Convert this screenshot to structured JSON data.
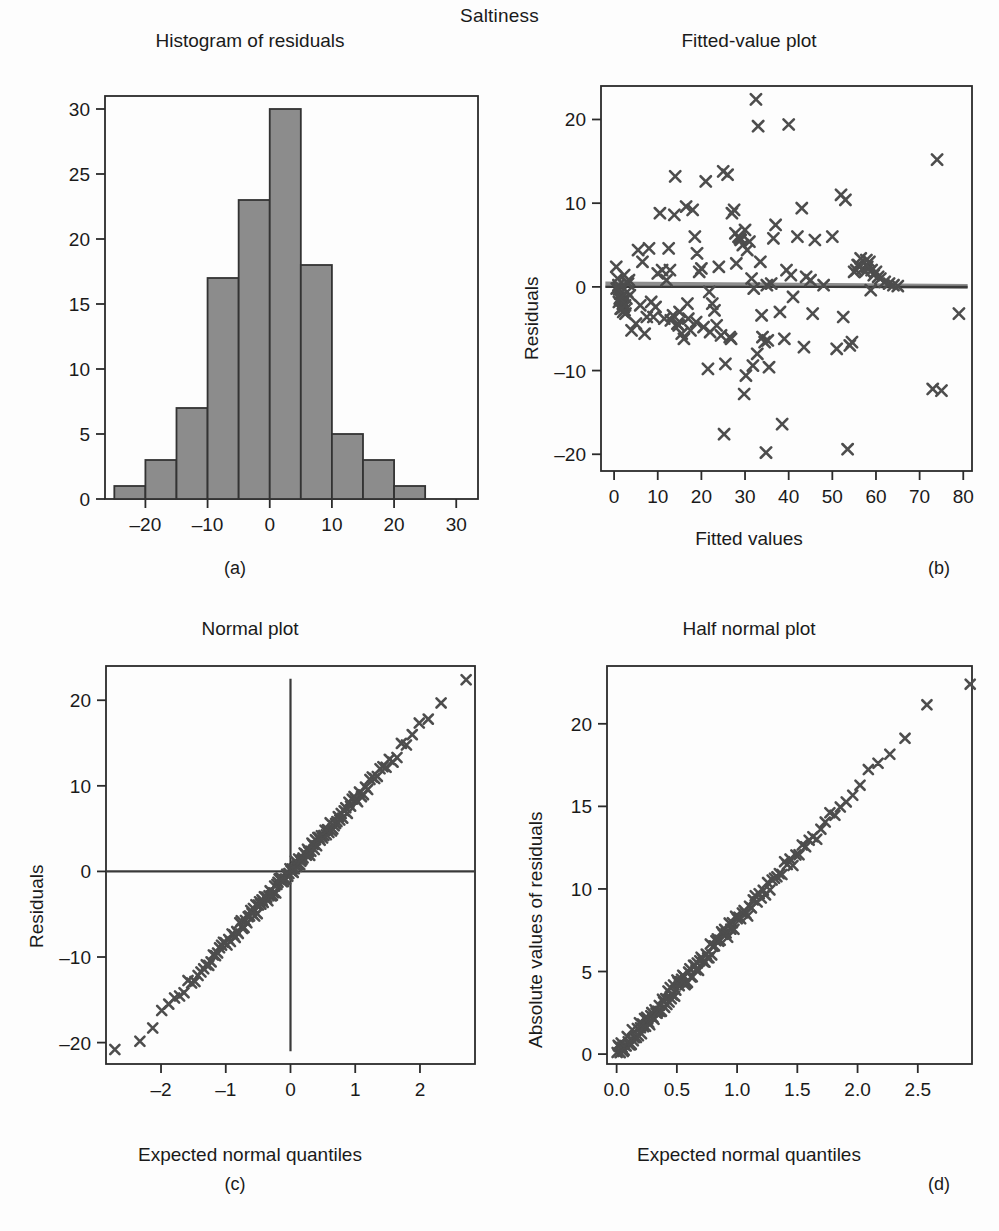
{
  "figure": {
    "suptitle": "Saltiness",
    "marker_color": "#4d4d4d",
    "bar_fill": "#8c8c8c",
    "bar_stroke": "#333333",
    "axis_color": "#2b2b2b"
  },
  "panels": [
    {
      "id": "a",
      "caption": "(a)",
      "title": "Histogram of residuals",
      "xlabel": "",
      "ylabel": "",
      "xticks": [
        -20,
        -10,
        0,
        10,
        20,
        30
      ],
      "xtick_labels": [
        "–20",
        "–10",
        "0",
        "10",
        "20",
        "30"
      ],
      "yticks": [
        0,
        5,
        10,
        15,
        20,
        25,
        30
      ],
      "ytick_labels": [
        "0",
        "5",
        "10",
        "15",
        "20",
        "25",
        "30"
      ]
    },
    {
      "id": "b",
      "caption": "(b)",
      "title": "Fitted-value plot",
      "xlabel": "Fitted values",
      "ylabel": "Residuals",
      "xticks": [
        0,
        10,
        20,
        30,
        40,
        50,
        60,
        70,
        80
      ],
      "xtick_labels": [
        "0",
        "10",
        "20",
        "30",
        "40",
        "50",
        "60",
        "70",
        "80"
      ],
      "yticks": [
        -20,
        -10,
        0,
        10,
        20
      ],
      "ytick_labels": [
        "–20",
        "–10",
        "0",
        "10",
        "20"
      ]
    },
    {
      "id": "c",
      "caption": "(c)",
      "title": "Normal plot",
      "xlabel": "Expected normal quantiles",
      "ylabel": "Residuals",
      "xticks": [
        -2,
        -1,
        0,
        1,
        2
      ],
      "xtick_labels": [
        "–2",
        "–1",
        "0",
        "1",
        "2"
      ],
      "yticks": [
        -20,
        -10,
        0,
        10,
        20
      ],
      "ytick_labels": [
        "–20",
        "–10",
        "0",
        "10",
        "20"
      ]
    },
    {
      "id": "d",
      "caption": "(d)",
      "title": "Half normal plot",
      "xlabel": "Expected normal quantiles",
      "ylabel": "Absolute values of residuals",
      "xticks": [
        0.0,
        0.5,
        1.0,
        1.5,
        2.0,
        2.5
      ],
      "xtick_labels": [
        "0.0",
        "0.5",
        "1.0",
        "1.5",
        "2.0",
        "2.5"
      ],
      "yticks": [
        0,
        5,
        10,
        15,
        20
      ],
      "ytick_labels": [
        "0",
        "5",
        "10",
        "15",
        "20"
      ]
    }
  ],
  "chart_data": [
    {
      "type": "bar",
      "title": "Histogram of residuals",
      "xlabel": "",
      "ylabel": "",
      "xlim": [
        -26.5,
        33.5
      ],
      "ylim": [
        0,
        31
      ],
      "grid": false,
      "bin_width": 5,
      "bin_edges": [
        -25,
        -20,
        -15,
        -10,
        -5,
        0,
        5,
        10,
        15,
        20,
        25
      ],
      "categories": [
        "[-25,-20)",
        "[-20,-15)",
        "[-15,-10)",
        "[-10,-5)",
        "[-5,0)",
        "[0,5)",
        "[5,10)",
        "[10,15)",
        "[15,20)",
        "[20,25)"
      ],
      "values": [
        1,
        3,
        7,
        17,
        23,
        30,
        18,
        5,
        3,
        1
      ]
    },
    {
      "type": "scatter",
      "title": "Fitted-value plot",
      "xlabel": "Fitted values",
      "ylabel": "Residuals",
      "xlim": [
        -3,
        82
      ],
      "ylim": [
        -22,
        24
      ],
      "grid": false,
      "reference_line_y": 0,
      "marker": "x",
      "x": [
        0.5,
        0.8,
        1.0,
        1.2,
        1.4,
        1.6,
        1.8,
        2.0,
        2.2,
        2.4,
        2.6,
        2.8,
        3.0,
        3.2,
        0.6,
        1.1,
        1.5,
        2.1,
        2.5,
        3.4,
        5.5,
        6.5,
        7.0,
        8.0,
        9.0,
        10.0,
        10.5,
        11.0,
        12.0,
        12.5,
        13.0,
        13.5,
        14.0,
        14.5,
        15.0,
        15.5,
        16.0,
        16.5,
        17.0,
        17.5,
        18.0,
        18.5,
        19.0,
        19.5,
        20.0,
        20.5,
        21.0,
        21.5,
        22.0,
        23.0,
        24.0,
        25.0,
        25.5,
        26.0,
        26.5,
        27.0,
        27.5,
        28.0,
        28.5,
        29.0,
        29.5,
        30.0,
        30.5,
        31.0,
        31.5,
        32.0,
        32.5,
        33.0,
        33.5,
        34.0,
        34.5,
        35.0,
        35.5,
        36.0,
        37.0,
        38.0,
        39.0,
        40.0,
        41.0,
        42.0,
        43.0,
        44.0,
        45.0,
        46.0,
        48.0,
        50.0,
        51.0,
        52.0,
        53.0,
        54.0,
        54.5,
        55.0,
        55.5,
        56.0,
        56.5,
        57.0,
        57.5,
        58.0,
        58.5,
        59.0,
        59.5,
        60.0,
        60.5,
        61.0,
        62.0,
        63.0,
        64.0,
        65.0,
        73.0,
        74.0,
        75.0,
        79.0,
        4.0,
        5.0,
        6.0,
        7.5,
        8.5,
        9.5,
        11.5,
        13.8,
        16.8,
        18.8,
        21.8,
        24.5,
        26.8,
        28.8,
        31.8,
        33.8,
        36.5,
        39.5,
        43.5,
        52.5,
        55.8,
        58.8,
        2.9,
        3.6,
        1.3,
        1.7,
        2.3,
        12.8,
        14.8,
        22.5,
        23.5,
        27.8,
        29.8,
        32.8,
        34.8,
        38.5,
        40.5,
        25.2,
        30.2,
        35.2,
        45.5,
        53.5,
        57.8
      ],
      "y": [
        2.4,
        1.0,
        0.2,
        -0.3,
        -0.8,
        -1.2,
        -1.6,
        -2.0,
        -2.4,
        -2.8,
        -3.2,
        -1.4,
        -0.6,
        0.4,
        -0.2,
        -1.8,
        -2.6,
        -3.0,
        -2.2,
        0.8,
        4.4,
        3.0,
        -5.6,
        4.6,
        -3.6,
        1.6,
        8.8,
        2.0,
        0.8,
        4.6,
        -4.0,
        -3.4,
        13.2,
        -4.4,
        -3.0,
        -5.6,
        -6.2,
        9.6,
        -3.8,
        -5.2,
        9.2,
        6.0,
        4.0,
        1.8,
        2.2,
        -4.8,
        12.6,
        -9.8,
        -5.4,
        -2.8,
        2.4,
        13.8,
        -9.2,
        13.4,
        -6.0,
        8.8,
        9.2,
        2.8,
        6.0,
        5.6,
        5.0,
        6.8,
        4.4,
        5.4,
        1.0,
        -0.2,
        22.4,
        19.2,
        3.0,
        -6.0,
        -6.6,
        0.2,
        -9.6,
        0.4,
        7.4,
        -3.0,
        -6.2,
        19.4,
        -1.2,
        6.0,
        9.4,
        1.2,
        0.8,
        5.6,
        0.2,
        6.0,
        -7.4,
        11.0,
        10.4,
        -7.0,
        -6.6,
        1.8,
        2.0,
        2.6,
        3.4,
        2.2,
        1.8,
        2.4,
        3.0,
        2.0,
        1.4,
        1.8,
        1.2,
        1.0,
        0.6,
        0.4,
        0.2,
        0.1,
        -12.2,
        15.2,
        -12.4,
        -3.2,
        -5.2,
        -4.4,
        -2.2,
        -3.6,
        -1.8,
        -2.4,
        -3.8,
        8.6,
        -2.0,
        -4.2,
        -0.6,
        -5.8,
        -6.2,
        5.8,
        -9.4,
        -3.4,
        5.8,
        2.0,
        -7.2,
        -3.6,
        2.6,
        -0.4,
        0.6,
        -1.0,
        -1.4,
        -2.6,
        1.4,
        2.0,
        -4.6,
        -2.0,
        -4.6,
        6.4,
        -12.8,
        -8.0,
        -19.8,
        -16.4,
        1.4,
        -17.6,
        -10.6,
        -6.4,
        -3.2,
        -19.4,
        3.2
      ]
    },
    {
      "type": "scatter",
      "title": "Normal plot",
      "xlabel": "Expected normal quantiles",
      "ylabel": "Residuals",
      "xlim": [
        -2.85,
        2.85
      ],
      "ylim": [
        -22.5,
        24
      ],
      "grid": false,
      "reference_line_x": 0,
      "reference_line_y": 0,
      "marker": "x",
      "description": "Q-Q plot of residuals against expected normal quantiles; points lie close to a straight line through the origin with slope approximately 8.4",
      "slope": 8.4,
      "n_points": 150,
      "min_point": [
        -2.55,
        -20.8
      ],
      "max_point": [
        2.55,
        22.4
      ]
    },
    {
      "type": "scatter",
      "title": "Half normal plot",
      "xlabel": "Expected normal quantiles",
      "ylabel": "Absolute values of residuals",
      "xlim": [
        -0.08,
        2.95
      ],
      "ylim": [
        -0.6,
        23.5
      ],
      "grid": false,
      "marker": "x",
      "description": "Half-normal plot of absolute residuals; points follow a near straight line from the origin with slope approximately 8.1",
      "slope": 8.1,
      "n_points": 150,
      "min_point": [
        0.01,
        0.1
      ],
      "max_point": [
        2.78,
        22.4
      ]
    }
  ]
}
